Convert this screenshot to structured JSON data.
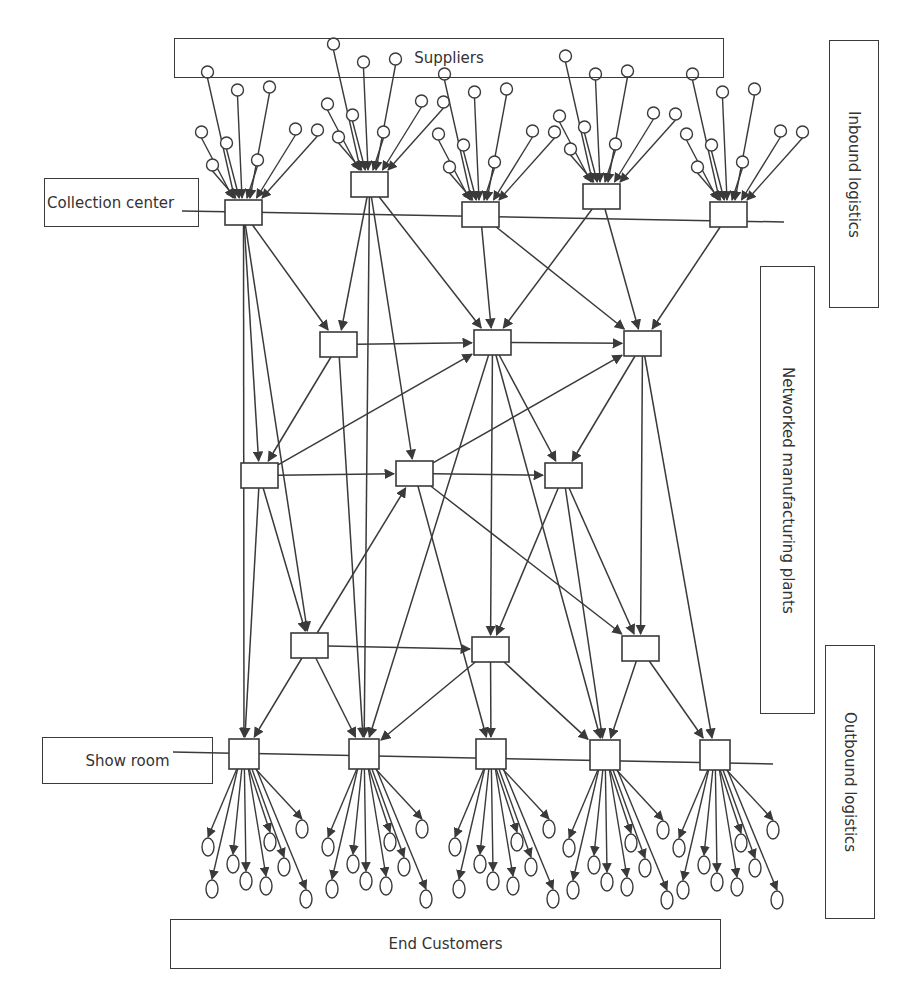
{
  "labels": {
    "suppliers": "Suppliers",
    "collection_center": "Collection center",
    "inbound_logistics": "Inbound logistics",
    "networked_plants": "Networked manufacturing plants",
    "outbound_logistics": "Outbound logistics",
    "show_room": "Show room",
    "end_customers": "End Customers"
  },
  "colors": {
    "stroke": "#3a3a3a",
    "background": "#ffffff"
  },
  "label_boxes": {
    "suppliers": {
      "x": 174,
      "y": 38,
      "w": 550,
      "h": 40
    },
    "collection_center": {
      "x": 44,
      "y": 178,
      "w": 155,
      "h": 49
    },
    "inbound_logistics": {
      "x": 829,
      "y": 40,
      "w": 50,
      "h": 268
    },
    "networked_plants": {
      "x": 760,
      "y": 266,
      "w": 55,
      "h": 448
    },
    "outbound_logistics": {
      "x": 825,
      "y": 645,
      "w": 50,
      "h": 274
    },
    "show_room": {
      "x": 42,
      "y": 737,
      "w": 171,
      "h": 47
    },
    "end_customers": {
      "x": 170,
      "y": 919,
      "w": 551,
      "h": 50
    }
  },
  "tier_lines": [
    {
      "name": "inbound-divider",
      "x1": 182,
      "y1": 211,
      "x2": 784,
      "y2": 222
    },
    {
      "name": "outbound-divider",
      "x1": 173,
      "y1": 752,
      "x2": 773,
      "y2": 764
    }
  ],
  "collection_centers": [
    {
      "id": "C1",
      "x": 225,
      "y": 200,
      "w": 37,
      "h": 25
    },
    {
      "id": "C2",
      "x": 351,
      "y": 172,
      "w": 37,
      "h": 25
    },
    {
      "id": "C3",
      "x": 462,
      "y": 202,
      "w": 37,
      "h": 25
    },
    {
      "id": "C4",
      "x": 583,
      "y": 184,
      "w": 37,
      "h": 25
    },
    {
      "id": "C5",
      "x": 710,
      "y": 202,
      "w": 37,
      "h": 25
    }
  ],
  "plants": [
    {
      "id": "P1",
      "x": 320,
      "y": 332,
      "w": 37,
      "h": 25
    },
    {
      "id": "P2",
      "x": 474,
      "y": 330,
      "w": 37,
      "h": 25
    },
    {
      "id": "P3",
      "x": 624,
      "y": 331,
      "w": 37,
      "h": 25
    },
    {
      "id": "P4",
      "x": 241,
      "y": 463,
      "w": 37,
      "h": 25
    },
    {
      "id": "P5",
      "x": 396,
      "y": 461,
      "w": 37,
      "h": 25
    },
    {
      "id": "P6",
      "x": 545,
      "y": 463,
      "w": 37,
      "h": 25
    },
    {
      "id": "P7",
      "x": 291,
      "y": 633,
      "w": 37,
      "h": 25
    },
    {
      "id": "P8",
      "x": 472,
      "y": 637,
      "w": 37,
      "h": 25
    },
    {
      "id": "P9",
      "x": 622,
      "y": 636,
      "w": 37,
      "h": 25
    }
  ],
  "show_rooms": [
    {
      "id": "S1",
      "x": 229,
      "y": 739,
      "w": 30,
      "h": 30
    },
    {
      "id": "S2",
      "x": 349,
      "y": 739,
      "w": 30,
      "h": 30
    },
    {
      "id": "S3",
      "x": 476,
      "y": 739,
      "w": 30,
      "h": 30
    },
    {
      "id": "S4",
      "x": 590,
      "y": 740,
      "w": 30,
      "h": 30
    },
    {
      "id": "S5",
      "x": 700,
      "y": 740,
      "w": 30,
      "h": 30
    }
  ],
  "supplier_fan_offsets": [
    [
      -42,
      -68
    ],
    [
      -36,
      -128
    ],
    [
      -6,
      -110
    ],
    [
      -17,
      -57
    ],
    [
      26,
      -113
    ],
    [
      14,
      -40
    ],
    [
      52,
      -71
    ],
    [
      74,
      -70
    ],
    [
      -31,
      -35
    ]
  ],
  "customer_fan_offsets": [
    [
      -36,
      78
    ],
    [
      -32,
      120
    ],
    [
      2,
      112
    ],
    [
      -11,
      95
    ],
    [
      22,
      117
    ],
    [
      26,
      73
    ],
    [
      40,
      98
    ],
    [
      58,
      60
    ],
    [
      62,
      130
    ]
  ],
  "edges": [
    [
      "C1",
      "P1"
    ],
    [
      "C1",
      "P4"
    ],
    [
      "C1",
      "P7"
    ],
    [
      "C1",
      "S1"
    ],
    [
      "C2",
      "P1"
    ],
    [
      "C2",
      "P2"
    ],
    [
      "C2",
      "P5"
    ],
    [
      "C3",
      "P2"
    ],
    [
      "C3",
      "P3"
    ],
    [
      "C4",
      "P2"
    ],
    [
      "C4",
      "P3"
    ],
    [
      "C5",
      "P3"
    ],
    [
      "P1",
      "P2"
    ],
    [
      "P1",
      "P4"
    ],
    [
      "P1",
      "S2"
    ],
    [
      "P2",
      "P3"
    ],
    [
      "P2",
      "P6"
    ],
    [
      "P2",
      "P8"
    ],
    [
      "P2",
      "S2"
    ],
    [
      "P2",
      "S4"
    ],
    [
      "P3",
      "P6"
    ],
    [
      "P3",
      "P9"
    ],
    [
      "P3",
      "S5"
    ],
    [
      "P4",
      "P2"
    ],
    [
      "P4",
      "P5"
    ],
    [
      "P4",
      "P7"
    ],
    [
      "P4",
      "S1"
    ],
    [
      "P5",
      "P3"
    ],
    [
      "P5",
      "P6"
    ],
    [
      "P5",
      "S3"
    ],
    [
      "P5",
      "P9"
    ],
    [
      "P6",
      "P8"
    ],
    [
      "P6",
      "P9"
    ],
    [
      "P7",
      "P5"
    ],
    [
      "P7",
      "P8"
    ],
    [
      "P7",
      "S1"
    ],
    [
      "P7",
      "S2"
    ],
    [
      "P8",
      "S2"
    ],
    [
      "P8",
      "S3"
    ],
    [
      "P8",
      "S4"
    ],
    [
      "P9",
      "S4"
    ],
    [
      "P9",
      "S5"
    ],
    [
      "C2",
      "S2"
    ],
    [
      "P6",
      "S4"
    ]
  ]
}
